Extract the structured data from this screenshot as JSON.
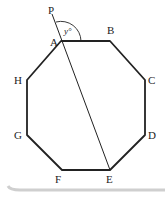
{
  "diagram": {
    "type": "regular-octagon",
    "vertices": [
      {
        "label": "A",
        "x": 61,
        "y": 41,
        "lx": 50,
        "ly": 46
      },
      {
        "label": "B",
        "x": 110,
        "y": 41,
        "lx": 107,
        "ly": 34
      },
      {
        "label": "C",
        "x": 145,
        "y": 80,
        "lx": 148,
        "ly": 84
      },
      {
        "label": "D",
        "x": 145,
        "y": 135,
        "lx": 148,
        "ly": 139
      },
      {
        "label": "E",
        "x": 110,
        "y": 170,
        "lx": 106,
        "ly": 183
      },
      {
        "label": "F",
        "x": 62,
        "y": 170,
        "lx": 55,
        "ly": 183
      },
      {
        "label": "G",
        "x": 27,
        "y": 135,
        "lx": 14,
        "ly": 139
      },
      {
        "label": "H",
        "x": 27,
        "y": 80,
        "lx": 14,
        "ly": 84
      }
    ],
    "extra_point": {
      "label": "P",
      "x": 52,
      "y": 12,
      "lx": 48,
      "ly": 14
    },
    "angle_label": "y°",
    "line_AE": "A to E extended to P",
    "stroke_color": "#222222"
  }
}
